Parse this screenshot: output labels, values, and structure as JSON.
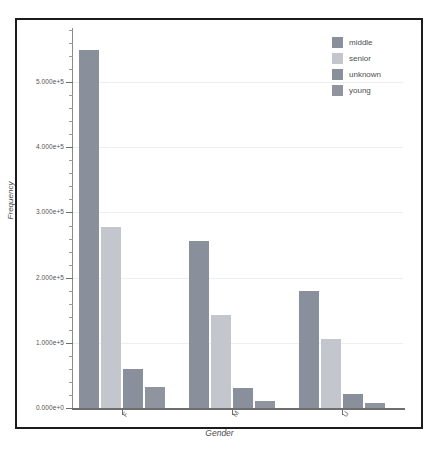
{
  "chart_data": {
    "type": "bar",
    "title": "",
    "xlabel": "Gender",
    "ylabel": "Frequency",
    "categories": [
      "F",
      "M",
      "U"
    ],
    "series": [
      {
        "name": "middle",
        "values": [
          550000,
          257000,
          179000
        ],
        "color": "#8a8f9c"
      },
      {
        "name": "senior",
        "values": [
          277000,
          142000,
          106000
        ],
        "color": "#c3c6cc"
      },
      {
        "name": "unknown",
        "values": [
          60000,
          30000,
          22000
        ],
        "color": "#8a8f9c"
      },
      {
        "name": "young",
        "values": [
          32000,
          10000,
          7000
        ],
        "color": "#8f949f"
      }
    ],
    "ylim": [
      0,
      580000
    ],
    "y_ticks": [
      0,
      100000,
      200000,
      300000,
      400000,
      500000
    ],
    "y_tick_labels": [
      "0.000e+0",
      "1.000e+5",
      "2.000e+5",
      "3.000e+5",
      "4.000e+5",
      "5.000e+5"
    ],
    "y_minor_ticks_per_major": 5,
    "grid": true,
    "legend_position": "top-right",
    "legend_entries": [
      "middle",
      "senior",
      "unknown",
      "young"
    ]
  },
  "style": {
    "frame_color": "#1c1c1c",
    "axis_color": "#6e6e6e",
    "grid_color": "#eceef0",
    "background": "#ffffff",
    "text_color": "#4e4e4e"
  }
}
